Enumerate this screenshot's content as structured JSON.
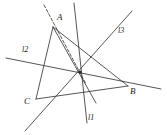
{
  "figure": {
    "type": "geometry-diagram",
    "width": 167,
    "height": 135,
    "background": "#ffffff",
    "stroke_color": "#2b2b2b",
    "stroke_width": 0.8
  },
  "vertices": [
    {
      "id": "A",
      "label": "A",
      "x": 53,
      "y": 27,
      "label_x": 57,
      "label_y": 13
    },
    {
      "id": "B",
      "label": "B",
      "x": 128,
      "y": 86,
      "label_x": 130,
      "label_y": 87
    },
    {
      "id": "C",
      "label": "C",
      "x": 36,
      "y": 99,
      "label_x": 24,
      "label_y": 97
    }
  ],
  "concurrency_point": {
    "x": 80,
    "y": 72,
    "radius": 1.6
  },
  "line_labels": [
    {
      "id": "l1",
      "label": "l1",
      "x": 88,
      "y": 114
    },
    {
      "id": "l2",
      "label": "l2",
      "x": 22,
      "y": 46
    },
    {
      "id": "l3",
      "label": "l3",
      "x": 118,
      "y": 27
    }
  ],
  "segments": [
    {
      "name": "side-AB",
      "x1": 53,
      "y1": 27,
      "x2": 128,
      "y2": 86,
      "dashed": false
    },
    {
      "name": "side-AC",
      "x1": 53,
      "y1": 27,
      "x2": 36,
      "y2": 99,
      "dashed": false
    },
    {
      "name": "side-CB",
      "x1": 36,
      "y1": 99,
      "x2": 128,
      "y2": 86,
      "dashed": false
    },
    {
      "name": "line-l1",
      "x1": 74,
      "y1": 3,
      "x2": 87,
      "y2": 123,
      "dashed": false
    },
    {
      "name": "line-l2",
      "x1": 6,
      "y1": 58,
      "x2": 161,
      "y2": 89,
      "dashed": false
    },
    {
      "name": "line-l3",
      "x1": 132,
      "y1": 11,
      "x2": 25,
      "y2": 131,
      "dashed": false
    },
    {
      "name": "cevian-A-to-CB",
      "x1": 53,
      "y1": 27,
      "x2": 96,
      "y2": 103,
      "dashed": false
    },
    {
      "name": "dashed-through-A",
      "x1": 44,
      "y1": 5,
      "x2": 86,
      "y2": 84,
      "dashed": true
    }
  ]
}
